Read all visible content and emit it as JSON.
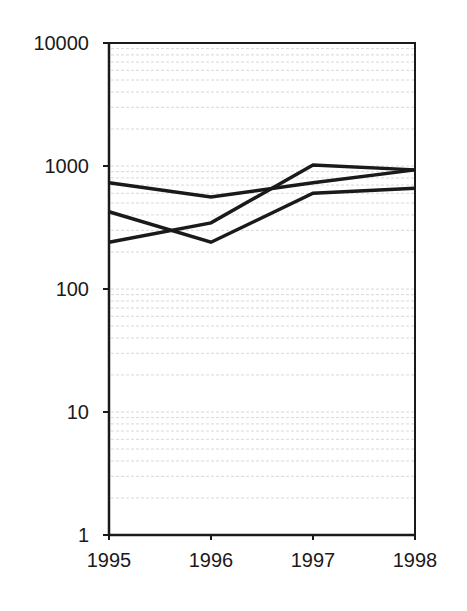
{
  "chart_data": {
    "type": "line",
    "title": "",
    "xlabel": "",
    "ylabel": "",
    "yscale": "log",
    "ylim": [
      1,
      10000
    ],
    "grid": "minor horizontal log gridlines (faint)",
    "legend": null,
    "x": [
      1995,
      1996,
      1997,
      1998
    ],
    "x_tick_labels": [
      "1995",
      "1996",
      "1997",
      "1998"
    ],
    "y_tick_labels": [
      "1",
      "10",
      "100",
      "1000",
      "10000"
    ],
    "y_ticks": [
      1,
      10,
      100,
      1000,
      10000
    ],
    "series": [
      {
        "name": "Series A",
        "values": [
          730,
          560,
          730,
          930
        ],
        "color": "#1a1a1a"
      },
      {
        "name": "Series B",
        "values": [
          425,
          240,
          600,
          660
        ],
        "color": "#1a1a1a"
      },
      {
        "name": "Series C",
        "values": [
          240,
          345,
          1020,
          930
        ],
        "color": "#1a1a1a"
      }
    ]
  },
  "style": {
    "line_color": "#1a1a1a",
    "axis_color": "#1a1a1a",
    "grid_color": "#d8d8d8",
    "background": "#ffffff"
  }
}
